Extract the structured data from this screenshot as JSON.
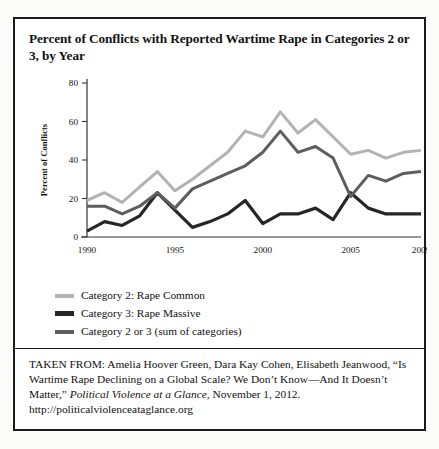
{
  "title": "Percent of Conflicts with Reported Wartime Rape in Categories 2 or 3, by Year",
  "colors": {
    "category2": "#b3b3b3",
    "category3": "#262626",
    "category2or3": "#5e5e5e",
    "axis": "#333333",
    "border": "#1b1b1b"
  },
  "legend": {
    "items": [
      {
        "label": "Category 2: Rape Common",
        "color": "#b3b3b3"
      },
      {
        "label": "Category 3: Rape Massive",
        "color": "#262626"
      },
      {
        "label": "Category 2 or 3 (sum of categories)",
        "color": "#5e5e5e"
      }
    ]
  },
  "source": {
    "prefix": "TAKEN FROM: Amelia Hoover Green, Dara Kay Cohen, Elisabeth Jeanwood, “Is Wartime Rape Declining on a Global Scale? We Don’t Know—And It Doesn’t Matter,” ",
    "italic": "Political Violence at a Glance",
    "suffix": ", November 1, 2012. http://politicalviolenceataglance.org"
  },
  "chart_data": {
    "type": "line",
    "title": "Percent of Conflicts with Reported Wartime Rape in Categories 2 or 3, by Year",
    "xlabel": "",
    "ylabel": "Percent of Conflicts",
    "xlim": [
      1990,
      2009
    ],
    "ylim": [
      0,
      80
    ],
    "yticks": [
      0,
      20,
      40,
      60,
      80
    ],
    "xticks": [
      1990,
      1995,
      2000,
      2005,
      2009
    ],
    "grid": false,
    "legend_position": "below",
    "x": [
      1990,
      1991,
      1992,
      1993,
      1994,
      1995,
      1996,
      1997,
      1998,
      1999,
      2000,
      2001,
      2002,
      2003,
      2004,
      2005,
      2006,
      2007,
      2008,
      2009
    ],
    "series": [
      {
        "name": "Category 2: Rape Common",
        "color": "#b3b3b3",
        "values": [
          19,
          23,
          18,
          26,
          34,
          24,
          30,
          37,
          44,
          55,
          52,
          65,
          54,
          61,
          52,
          43,
          45,
          41,
          44,
          45
        ]
      },
      {
        "name": "Category 3: Rape Massive",
        "color": "#262626",
        "values": [
          3,
          8,
          6,
          11,
          23,
          14,
          5,
          8,
          12,
          19,
          7,
          12,
          12,
          15,
          9,
          23,
          15,
          12,
          12,
          12
        ]
      },
      {
        "name": "Category 2 or 3 (sum of categories)",
        "color": "#5e5e5e",
        "values": [
          16,
          16,
          12,
          16,
          23,
          15,
          25,
          29,
          33,
          37,
          44,
          55,
          44,
          47,
          41,
          21,
          32,
          29,
          33,
          34
        ]
      }
    ]
  }
}
